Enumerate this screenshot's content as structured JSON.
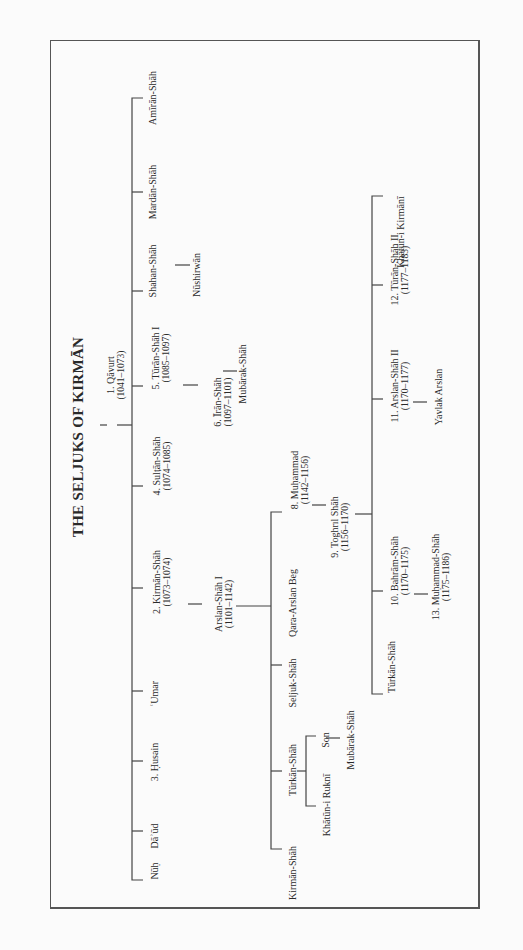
{
  "people": {
    "qavurt": {
      "name": "1. Qāvurt",
      "dates": "(1041–1073)"
    },
    "amiran": {
      "name": "Amīrān-Shāh"
    },
    "mardan": {
      "name": "Mardān-Shāh"
    },
    "shahan": {
      "name": "Shahan-Shāh"
    },
    "nushirwan": {
      "name": "Nūshirwān"
    },
    "turan1": {
      "name": "5. Tūrān-Shāh I",
      "dates": "(1085–1097)"
    },
    "iran": {
      "name": "6. Īrān-Shāh",
      "dates": "(1097–1101)"
    },
    "mubarak1": {
      "name": "Mubārak-Shāh"
    },
    "sultan": {
      "name": "4. Sulṭān-Shāh",
      "dates": "(1074–1085)"
    },
    "kirman2": {
      "name": "2. Kirmān-Shāh",
      "dates": "(1073–1074)"
    },
    "arslan1": {
      "name": "Arslan-Shāh I",
      "dates": "(1101–1142)"
    },
    "umar": {
      "name": "ʿUmar"
    },
    "husain": {
      "name": "3. Ḥusain"
    },
    "daud": {
      "name": "Dāʾūd"
    },
    "nuh": {
      "name": "Nūḥ"
    },
    "muhammad8": {
      "name": "8. Muḥammad",
      "dates": "(1142–1156)"
    },
    "qara": {
      "name": "Qara-Arslan Beg"
    },
    "seljuk": {
      "name": "Seljuk-Shāh"
    },
    "turkan1": {
      "name": "Tūrkān-Shāh"
    },
    "kirmanshah": {
      "name": "Kirmān-Shāh"
    },
    "son": {
      "name": "Son"
    },
    "khatun_rukni": {
      "name": "Khātūn-i Ruknī"
    },
    "mubarak2": {
      "name": "Mubārak-Shāh"
    },
    "toghril": {
      "name": "9. Toghrıl Shāh",
      "dates": "(1156–1170)"
    },
    "khatun_kirmani": {
      "name": "Khātūn-i Kirmānī"
    },
    "turan2": {
      "name": "12. Tūrān-Shāh II",
      "dates": "(1177–1183)"
    },
    "arslan2": {
      "name": "11. Arslan-Shāh II",
      "dates": "(1170–1177)"
    },
    "yavlak": {
      "name": "Yavlak Arslan"
    },
    "bahram": {
      "name": "10. Bahrām-Shāh",
      "dates": "(1170–1175)"
    },
    "muhammad13": {
      "name": "13. Muḥammad-Shāh",
      "dates": "(1175–1186)"
    },
    "turkan2": {
      "name": "Tūrkān-Shāh"
    }
  }
}
